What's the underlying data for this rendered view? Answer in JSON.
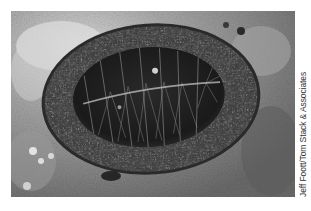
{
  "photo": {
    "subject": "chiton on rocky tide pool substrate",
    "tone": "grayscale",
    "credit": "Jeff Foott/Tom Stack & Associates",
    "colors": {
      "background": "#ffffff",
      "rock_light": "#d8d8d8",
      "rock_mid": "#8a8a8a",
      "girdle": "#3e3e3e",
      "plates": "#1c1c1c",
      "plate_highlight": "#bdbdbd",
      "credit_text": "#333333"
    }
  }
}
